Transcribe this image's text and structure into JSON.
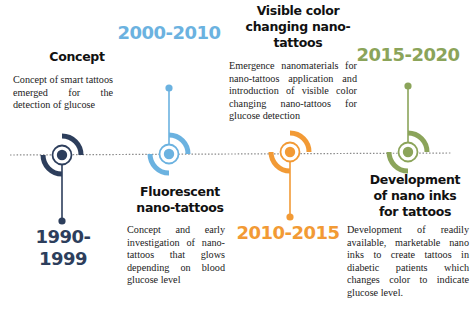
{
  "timeline": {
    "axis_style": "dotted",
    "axis_color": "#8a8a8a"
  },
  "events": [
    {
      "period": "1990-1999",
      "color": "#2d3e5c",
      "position": "below",
      "title": "Concept",
      "description": "Concept of smart tattoos emerged for the detection of glucose"
    },
    {
      "period": "2000-2010",
      "color": "#6bb2e0",
      "position": "above",
      "title": "Fluorescent nano-tattoos",
      "title_lines": [
        "Fluorescent",
        "nano-tattoos"
      ],
      "description": "Concept and early investigation of nano-tattoos that glows depending on blood glucose level"
    },
    {
      "period": "2010-2015",
      "color": "#f29a35",
      "position": "below",
      "title": "Visible color changing nano-tattoos",
      "title_lines": [
        "Visible color",
        "changing nano-",
        "tattoos"
      ],
      "description": "Emergence nanomaterials for nano-tattoos application and introduction of visible color changing nano-tattoos for glucose detection"
    },
    {
      "period": "2015-2020",
      "color": "#8ba45a",
      "position": "above",
      "title": "Development of nano inks for tattoos",
      "title_lines": [
        "Development",
        "of nano inks",
        "for tattoos"
      ],
      "description": "Development of readily available, marketable nano inks to create tattoos in diabetic patients which changes color to indicate glucose level."
    }
  ]
}
